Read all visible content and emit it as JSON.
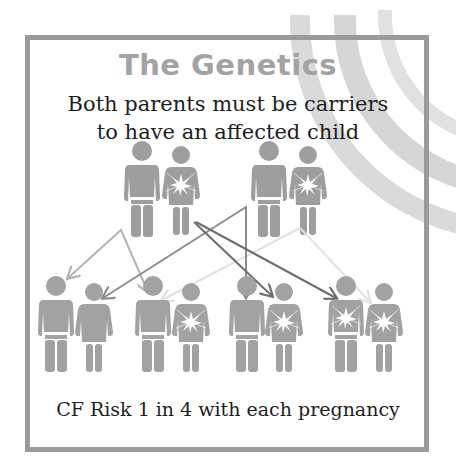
{
  "title": "The Genetics",
  "subtitle": {
    "line1": "Both parents must be carriers",
    "line2": "to have an affected child"
  },
  "footer": "CF Risk 1 in 4 with each pregnancy",
  "colors": {
    "figure": "#9e9e9e",
    "frame": "#9a9a9a",
    "title": "#a3a3a3",
    "text": "#1e1e1e",
    "arrow_light": "#b4b4b4",
    "arrow_medium": "#8c8c8c",
    "arrow_dark": "#6e6e6e",
    "arrow_faint": "#e0e0e0",
    "rainbow": "#d2d2d2"
  },
  "parents": [
    {
      "role": "father",
      "couple": 1,
      "carrier": false
    },
    {
      "role": "mother",
      "couple": 1,
      "carrier": true
    },
    {
      "role": "father",
      "couple": 2,
      "carrier": false
    },
    {
      "role": "mother",
      "couple": 2,
      "carrier": true
    }
  ],
  "children": [
    {
      "pair": 1,
      "status": "unaffected"
    },
    {
      "pair": 2,
      "status": "carrier"
    },
    {
      "pair": 3,
      "status": "carrier"
    },
    {
      "pair": 4,
      "status": "affected"
    }
  ]
}
